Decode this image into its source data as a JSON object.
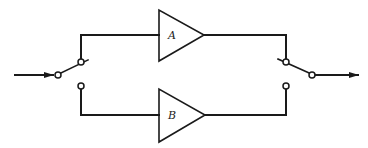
{
  "diagram": {
    "type": "block-diagram",
    "colors": {
      "stroke": "#1a1a1a",
      "background": "#ffffff"
    },
    "amplifiers": [
      {
        "id": "A",
        "label": "A"
      },
      {
        "id": "B",
        "label": "B"
      }
    ],
    "switches": [
      {
        "id": "input-switch",
        "position": "selects A"
      },
      {
        "id": "output-switch",
        "position": "selects A"
      }
    ],
    "input_arrow": "input-arrow",
    "output_arrow": "output-arrow"
  }
}
